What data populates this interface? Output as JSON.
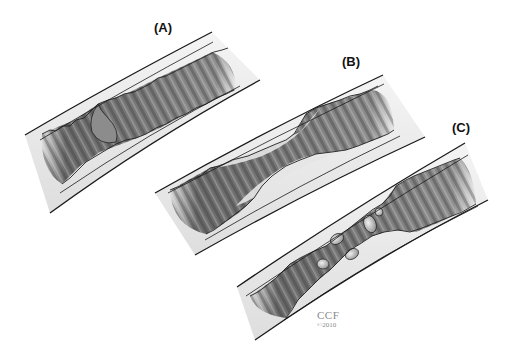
{
  "figure": {
    "panels": [
      {
        "id": "A",
        "label": "(A)",
        "description": "Artery segment with a small intimal flap / tear"
      },
      {
        "id": "B",
        "label": "(B)",
        "description": "Artery segment with smooth tapered narrowing of the lumen"
      },
      {
        "id": "C",
        "label": "(C)",
        "description": "Artery segment with irregular stenosis and nodular plaque fragments"
      }
    ],
    "credit": {
      "line1": "CCF",
      "line2": "©2010"
    },
    "colors": {
      "background": "#ffffff",
      "wall_outline": "#1a1a1a",
      "wall_fill": "#efefef",
      "lumen_dark": "#4a4a4a",
      "lumen_mid": "#9a9a9a",
      "credit": "#8a8a8a"
    }
  }
}
